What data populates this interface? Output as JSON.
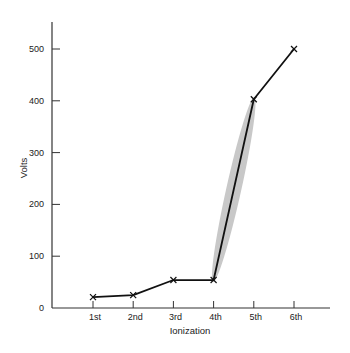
{
  "chart_data": {
    "type": "line",
    "title": "",
    "xlabel": "Ionization",
    "ylabel": "Volts",
    "categories": [
      "1st",
      "2nd",
      "3rd",
      "4th",
      "5th",
      "6th"
    ],
    "values": [
      21,
      25,
      54,
      54,
      403,
      500
    ],
    "ylim": [
      0,
      550
    ],
    "yticks": [
      0,
      100,
      200,
      300,
      400,
      500
    ],
    "grid": false,
    "legend": null,
    "marker": "x",
    "annotations": [
      {
        "type": "shaded-ellipse",
        "from": "4th",
        "to": "5th",
        "description": "gray highlight around the large jump between 4th and 5th ionization"
      }
    ],
    "colors": {
      "line": "#111111",
      "axis": "#333333",
      "highlight": "#c8c8c8"
    }
  }
}
